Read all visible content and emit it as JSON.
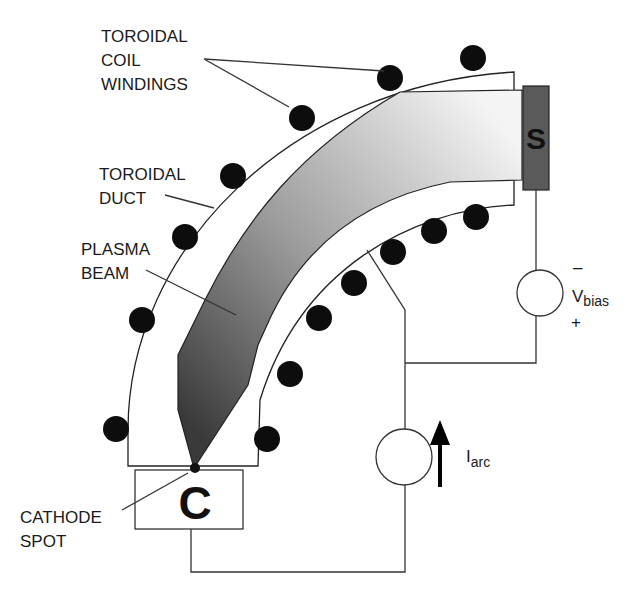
{
  "diagram": {
    "labels": {
      "coil_windings": [
        "TOROIDAL",
        "COIL",
        "WINDINGS"
      ],
      "duct": [
        "TOROIDAL",
        "DUCT"
      ],
      "plasma_beam": [
        "PLASMA",
        "BEAM"
      ],
      "cathode_spot": [
        "CATHODE",
        "SPOT"
      ]
    },
    "components": {
      "substrate_letter": "S",
      "cathode_letter": "C",
      "bias_source": {
        "symbol": "V",
        "subscript": "bias",
        "minus": "–",
        "plus": "+"
      },
      "arc_source": {
        "symbol": "I",
        "subscript": "arc"
      }
    },
    "colors": {
      "substrate_fill": "#5a5a5a",
      "plasma_dark": "#3a3a3a",
      "plasma_light": "#f2f2f2",
      "coil": "#0d0d0d"
    }
  }
}
